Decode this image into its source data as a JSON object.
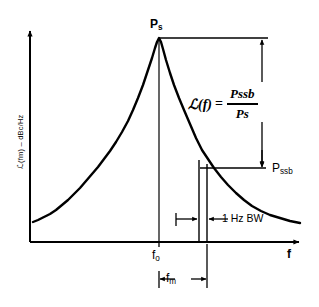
{
  "figure": {
    "title_text": "",
    "background_color": "#ffffff",
    "line_color": "#000000"
  },
  "axes": {
    "y_axis_label": "ℒ(fm) – dBc/Hz",
    "x_axis_label": "f",
    "x_tick_center_label": "f",
    "x_tick_center_sub": "o",
    "origin_x": 30,
    "origin_y": 242,
    "x_axis_end": 302,
    "y_axis_top": 28
  },
  "annotations": {
    "peak_label": "P",
    "peak_label_sub": "s",
    "sideband_label": "P",
    "sideband_label_sub": "ssb",
    "bandwidth_label": "1 Hz BW",
    "offset_label": "f",
    "offset_label_sub": "m"
  },
  "formula": {
    "lhs": "ℒ(f)",
    "equals": "=",
    "numerator": "Pssb",
    "denominator": "Ps"
  },
  "chart_data": {
    "type": "line",
    "title": "",
    "xlabel": "f",
    "ylabel": "ℒ(fm) – dBc/Hz",
    "grid": false,
    "legend": null,
    "xlim": [
      30,
      302
    ],
    "ylim": [
      242,
      38
    ],
    "markers": {
      "carrier_frequency_x": 159,
      "carrier_power_y": 38,
      "sideband_left_x": 199,
      "sideband_right_x": 207,
      "sideband_power_y": 168,
      "ps_line_y": 38,
      "ps_line_x_start": 159,
      "ps_line_x_end": 268,
      "pssb_line_y": 168,
      "pssb_line_x_start": 200,
      "pssb_line_x_end": 266,
      "ratio_arrow_x": 262,
      "fm_arrow_y": 279,
      "bw_arrow_y": 219
    },
    "curve_points": [
      [
        33,
        222
      ],
      [
        38,
        220
      ],
      [
        44,
        217
      ],
      [
        50,
        214
      ],
      [
        56,
        210
      ],
      [
        62,
        205
      ],
      [
        68,
        200
      ],
      [
        74,
        194
      ],
      [
        80,
        188
      ],
      [
        86,
        181
      ],
      [
        92,
        174
      ],
      [
        98,
        167
      ],
      [
        104,
        159
      ],
      [
        110,
        151
      ],
      [
        116,
        142
      ],
      [
        122,
        132
      ],
      [
        128,
        121
      ],
      [
        133,
        110
      ],
      [
        138,
        98
      ],
      [
        143,
        85
      ],
      [
        148,
        70
      ],
      [
        152,
        58
      ],
      [
        155,
        48
      ],
      [
        157,
        42
      ],
      [
        159,
        38
      ],
      [
        161,
        42
      ],
      [
        163,
        49
      ],
      [
        166,
        60
      ],
      [
        170,
        73
      ],
      [
        174,
        85
      ],
      [
        179,
        98
      ],
      [
        184,
        110
      ],
      [
        190,
        124
      ],
      [
        196,
        138
      ],
      [
        202,
        150
      ],
      [
        208,
        159
      ],
      [
        214,
        168
      ],
      [
        221,
        177
      ],
      [
        228,
        185
      ],
      [
        236,
        193
      ],
      [
        244,
        200
      ],
      [
        252,
        206
      ],
      [
        261,
        211
      ],
      [
        270,
        215
      ],
      [
        280,
        218
      ],
      [
        290,
        221
      ],
      [
        300,
        223
      ]
    ]
  }
}
